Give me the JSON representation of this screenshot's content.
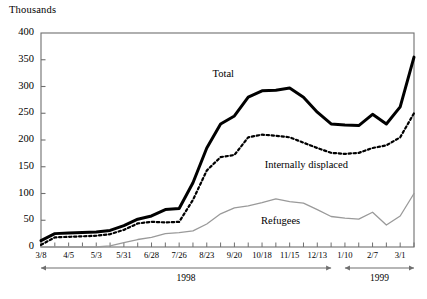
{
  "chart_data": {
    "type": "line",
    "title": "",
    "subtitle": "",
    "unit_label": "Thousands",
    "xlabel": "",
    "ylabel": "",
    "ylim": [
      0,
      400
    ],
    "ytick_values": [
      0,
      50,
      100,
      150,
      200,
      250,
      300,
      350,
      400
    ],
    "ytick_labels": [
      "0",
      "50",
      "100",
      "150",
      "200",
      "250",
      "300",
      "350",
      "400"
    ],
    "grid": false,
    "legend_position": "inline-annotations",
    "x": [
      "3/8",
      "3/22",
      "4/5",
      "4/19",
      "5/3",
      "5/17",
      "5/31",
      "6/14",
      "6/28",
      "7/12",
      "7/26",
      "8/9",
      "8/23",
      "9/6",
      "9/20",
      "10/4",
      "10/18",
      "11/1",
      "11/15",
      "11/29",
      "12/13",
      "12/27",
      "1/10",
      "1/24",
      "2/7",
      "2/21",
      "3/1",
      "3/15"
    ],
    "xtick_labels": [
      "3/8",
      "4/5",
      "5/3",
      "5/31",
      "6/28",
      "7/26",
      "8/23",
      "9/20",
      "10/18",
      "11/15",
      "12/13",
      "1/10",
      "2/7",
      "3/1"
    ],
    "series": [
      {
        "name": "Total",
        "style": "solid-thick",
        "color": "#000000",
        "values": [
          12,
          25,
          26,
          27,
          28,
          31,
          40,
          52,
          58,
          70,
          72,
          120,
          185,
          230,
          245,
          280,
          292,
          293,
          297,
          280,
          252,
          230,
          228,
          227,
          248,
          230,
          262,
          355
        ]
      },
      {
        "name": "Internally displaced",
        "style": "dotted",
        "color": "#000000",
        "values": [
          4,
          18,
          19,
          20,
          21,
          24,
          32,
          44,
          47,
          46,
          47,
          88,
          143,
          168,
          172,
          205,
          210,
          208,
          205,
          195,
          185,
          176,
          174,
          176,
          185,
          190,
          205,
          250
        ]
      },
      {
        "name": "Refugees",
        "style": "solid-thin",
        "color": "#9a9a9a",
        "values": [
          0,
          0,
          0,
          0,
          0,
          2,
          8,
          14,
          18,
          25,
          27,
          30,
          43,
          62,
          73,
          77,
          83,
          90,
          85,
          82,
          70,
          57,
          54,
          52,
          65,
          41,
          58,
          100
        ]
      }
    ],
    "annotations": [
      {
        "name": "total-label",
        "text": "Total",
        "x_frac": 0.46,
        "y_value": 320
      },
      {
        "name": "internally-displaced-label",
        "text": "Internally displaced",
        "x_frac": 0.6,
        "y_value": 150
      },
      {
        "name": "refugees-label",
        "text": "Refugees",
        "x_frac": 0.59,
        "y_value": 45
      }
    ],
    "period_bands": [
      {
        "label": "1998",
        "start_index": 0,
        "end_index": 21
      },
      {
        "label": "1999",
        "start_index": 22,
        "end_index": 27
      }
    ]
  }
}
